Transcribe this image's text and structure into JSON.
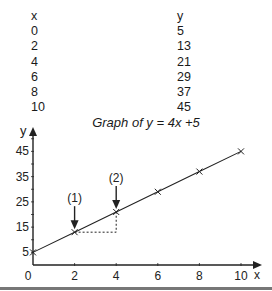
{
  "table": {
    "headers": [
      "x",
      "y"
    ],
    "rows": [
      [
        "0",
        "5"
      ],
      [
        "2",
        "13"
      ],
      [
        "4",
        "21"
      ],
      [
        "6",
        "29"
      ],
      [
        "8",
        "37"
      ],
      [
        "10",
        "45"
      ]
    ]
  },
  "chart_data": {
    "type": "line",
    "title": "Graph of y = 4x +5",
    "xlabel": "x",
    "ylabel": "y",
    "x": [
      0,
      2,
      4,
      6,
      8,
      10
    ],
    "series": [
      {
        "name": "y = 4x + 5",
        "values": [
          5,
          13,
          21,
          29,
          37,
          45
        ]
      }
    ],
    "xticks": [
      0,
      2,
      4,
      6,
      8,
      10
    ],
    "yticks": [
      5,
      15,
      25,
      35,
      45
    ],
    "xlim": [
      0,
      10.8
    ],
    "ylim": [
      0,
      52
    ],
    "grid": false,
    "annotations": [
      {
        "label": "(1)",
        "x": 2,
        "y": 13,
        "type": "arrow-down"
      },
      {
        "label": "(2)",
        "x": 4,
        "y": 21,
        "type": "arrow-down"
      }
    ],
    "rise_run_triangle": {
      "from": [
        2,
        13
      ],
      "to": [
        4,
        21
      ],
      "style": "dotted"
    }
  }
}
